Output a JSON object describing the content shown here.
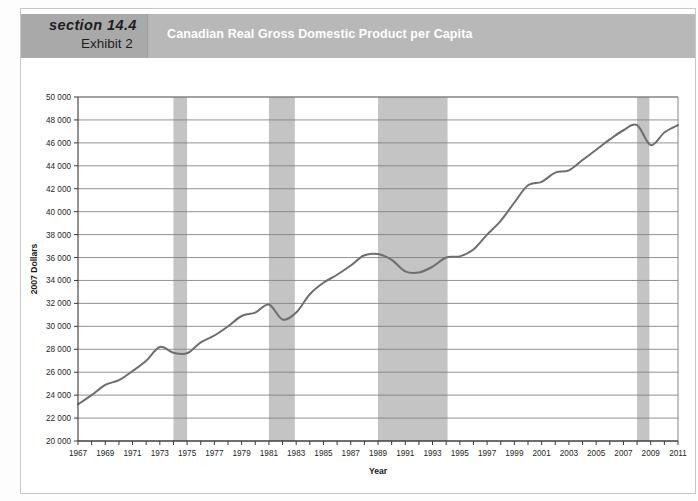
{
  "header": {
    "section": "section 14.4",
    "exhibit": "Exhibit 2",
    "title": "Canadian Real Gross Domestic Product per Capita",
    "band_color": "#b8b8b8",
    "left_block_color": "#a9a9a9",
    "title_color": "#ffffff"
  },
  "chart_data": {
    "type": "line",
    "title": "Canadian Real Gross Domestic Product per Capita",
    "xlabel": "Year",
    "ylabel": "2007 Dollars",
    "xlim": [
      1967,
      2011
    ],
    "ylim": [
      20000,
      50000
    ],
    "grid": true,
    "legend": "none",
    "line_color": "#6e6e6e",
    "shading_color": "#c4c4c4",
    "ytick_labels": [
      "20 000",
      "22 000",
      "24 000",
      "26 000",
      "28 000",
      "30 000",
      "32 000",
      "34 000",
      "36 000",
      "38 000",
      "40 000",
      "42 000",
      "44 000",
      "46 000",
      "48 000",
      "50 000"
    ],
    "ytick_values": [
      20000,
      22000,
      24000,
      26000,
      28000,
      30000,
      32000,
      34000,
      36000,
      38000,
      40000,
      42000,
      44000,
      46000,
      48000,
      50000
    ],
    "xtick_labels": [
      "1967",
      "1969",
      "1971",
      "1973",
      "1975",
      "1977",
      "1979",
      "1981",
      "1983",
      "1985",
      "1987",
      "1989",
      "1991",
      "1993",
      "1995",
      "1997",
      "1999",
      "2001",
      "2003",
      "2005",
      "2007",
      "2009",
      "2011"
    ],
    "xtick_values": [
      1967,
      1969,
      1971,
      1973,
      1975,
      1977,
      1979,
      1981,
      1983,
      1985,
      1987,
      1989,
      1991,
      1993,
      1995,
      1997,
      1999,
      2001,
      2003,
      2005,
      2007,
      2009,
      2011
    ],
    "x": [
      1967,
      1968,
      1969,
      1970,
      1971,
      1972,
      1973,
      1974,
      1975,
      1976,
      1977,
      1978,
      1979,
      1980,
      1981,
      1982,
      1983,
      1984,
      1985,
      1986,
      1987,
      1988,
      1989,
      1990,
      1991,
      1992,
      1993,
      1994,
      1995,
      1996,
      1997,
      1998,
      1999,
      2000,
      2001,
      2002,
      2003,
      2004,
      2005,
      2006,
      2007,
      2008,
      2009,
      2010,
      2011
    ],
    "values": [
      23200,
      24000,
      24900,
      25300,
      26100,
      27000,
      28200,
      27700,
      27650,
      28600,
      29200,
      30000,
      30900,
      31200,
      31900,
      30600,
      31200,
      32800,
      33800,
      34500,
      35300,
      36200,
      36300,
      35800,
      34800,
      34700,
      35200,
      36000,
      36100,
      36700,
      38000,
      39200,
      40800,
      42300,
      42600,
      43400,
      43600,
      44500,
      45400,
      46300,
      47100,
      47550,
      45800,
      46900,
      47550
    ],
    "annotations": [],
    "recession_bands": [
      {
        "label": "recession-band-1974",
        "start": 1974.0,
        "end": 1975.0
      },
      {
        "label": "recession-band-1981",
        "start": 1981.0,
        "end": 1982.9
      },
      {
        "label": "recession-band-1989",
        "start": 1989.0,
        "end": 1994.1
      },
      {
        "label": "recession-band-2008",
        "start": 2008.0,
        "end": 2008.9
      }
    ]
  }
}
